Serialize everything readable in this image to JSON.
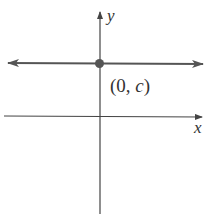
{
  "diagram": {
    "axes": {
      "x_label": "x",
      "y_label": "y"
    },
    "point": {
      "label_open": "(0, ",
      "label_var": "c",
      "label_close": ")"
    },
    "colors": {
      "line": "#555555",
      "axis": "#444444",
      "point": "#555555"
    }
  }
}
